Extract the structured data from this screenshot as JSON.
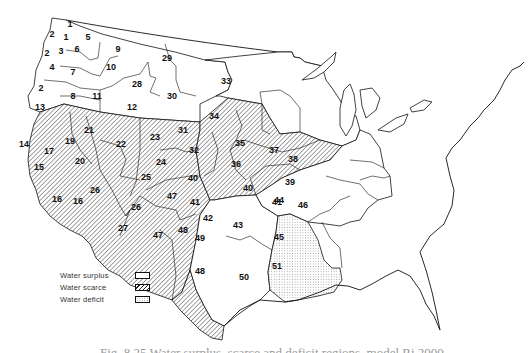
{
  "map": {
    "title": "Water resource regions of the conterminous western/central United States",
    "regions": [
      {
        "id": "1",
        "status": "surplus"
      },
      {
        "id": "2",
        "status": "surplus"
      },
      {
        "id": "3",
        "status": "surplus"
      },
      {
        "id": "4",
        "status": "surplus"
      },
      {
        "id": "5",
        "status": "surplus"
      },
      {
        "id": "6",
        "status": "surplus"
      },
      {
        "id": "7",
        "status": "surplus"
      },
      {
        "id": "8",
        "status": "scarce"
      },
      {
        "id": "9",
        "status": "surplus"
      },
      {
        "id": "10",
        "status": "surplus"
      },
      {
        "id": "11",
        "status": "surplus"
      },
      {
        "id": "12",
        "status": "surplus"
      },
      {
        "id": "13",
        "status": "surplus"
      },
      {
        "id": "14",
        "status": "surplus"
      },
      {
        "id": "15",
        "status": "scarce"
      },
      {
        "id": "16",
        "status": "scarce"
      },
      {
        "id": "17",
        "status": "scarce"
      },
      {
        "id": "18",
        "status": "scarce"
      },
      {
        "id": "19",
        "status": "scarce"
      },
      {
        "id": "20",
        "status": "scarce"
      },
      {
        "id": "21",
        "status": "scarce"
      },
      {
        "id": "22",
        "status": "scarce"
      },
      {
        "id": "23",
        "status": "scarce"
      },
      {
        "id": "24",
        "status": "surplus"
      },
      {
        "id": "25",
        "status": "scarce"
      },
      {
        "id": "26",
        "status": "scarce"
      },
      {
        "id": "27",
        "status": "scarce"
      },
      {
        "id": "28",
        "status": "surplus"
      },
      {
        "id": "29",
        "status": "surplus"
      },
      {
        "id": "30",
        "status": "surplus"
      },
      {
        "id": "31",
        "status": "scarce"
      },
      {
        "id": "32",
        "status": "scarce"
      },
      {
        "id": "33",
        "status": "surplus"
      },
      {
        "id": "34",
        "status": "surplus"
      },
      {
        "id": "35",
        "status": "scarce"
      },
      {
        "id": "36",
        "status": "scarce"
      },
      {
        "id": "37",
        "status": "surplus"
      },
      {
        "id": "38",
        "status": "surplus"
      },
      {
        "id": "39",
        "status": "surplus"
      },
      {
        "id": "40",
        "status": "scarce"
      },
      {
        "id": "41",
        "status": "scarce"
      },
      {
        "id": "42",
        "status": "scarce"
      },
      {
        "id": "43",
        "status": "surplus"
      },
      {
        "id": "44",
        "status": "surplus"
      },
      {
        "id": "45",
        "status": "surplus"
      },
      {
        "id": "46",
        "status": "surplus"
      },
      {
        "id": "47",
        "status": "scarce"
      },
      {
        "id": "48",
        "status": "scarce"
      },
      {
        "id": "49",
        "status": "scarce"
      },
      {
        "id": "50",
        "status": "surplus"
      },
      {
        "id": "51",
        "status": "deficit"
      }
    ]
  },
  "legend": {
    "items": [
      {
        "label": "Water surplus",
        "key": "surplus"
      },
      {
        "label": "Water scarce",
        "key": "scarce"
      },
      {
        "label": "Water deficit",
        "key": "deficit"
      }
    ]
  },
  "caption": "Fig. 8.25  Water surplus, scarce and deficit regions, model Ri 2000"
}
